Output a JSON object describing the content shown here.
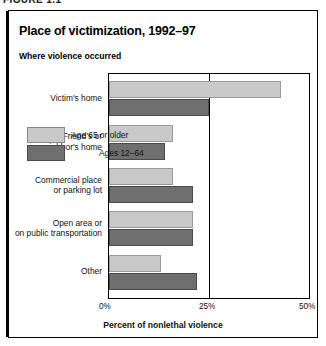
{
  "figure": {
    "caption": "FIGURE 1.1"
  },
  "chart_data": {
    "type": "bar",
    "orientation": "horizontal",
    "title": "Place of victimization, 1992–97",
    "subtitle": "Where violence occurred",
    "xlabel": "Percent of nonlethal violence",
    "ylabel": "",
    "xlim": [
      0,
      50
    ],
    "xticks": [
      0,
      25,
      50
    ],
    "xtick_labels": [
      "0%",
      "25%",
      "50%"
    ],
    "grid": false,
    "legend_position": "inside-left",
    "categories": [
      "Victim's home",
      "Friend's or neighbor's home",
      "Commercial place or parking lot",
      "Open area or on public transportation",
      "Other"
    ],
    "category_lines": [
      [
        "Victim's home"
      ],
      [
        "Friend's or",
        "neighbor's home"
      ],
      [
        "Commercial place",
        "or parking lot"
      ],
      [
        "Open area or",
        "on public transportation"
      ],
      [
        "Other"
      ]
    ],
    "series": [
      {
        "name": "Age 65 or older",
        "color": "#c9c9c9",
        "values": [
          43,
          16,
          16,
          21,
          13
        ]
      },
      {
        "name": "Ages 12–64",
        "color": "#6f6f6f",
        "values": [
          25,
          14,
          21,
          21,
          22
        ]
      }
    ]
  }
}
